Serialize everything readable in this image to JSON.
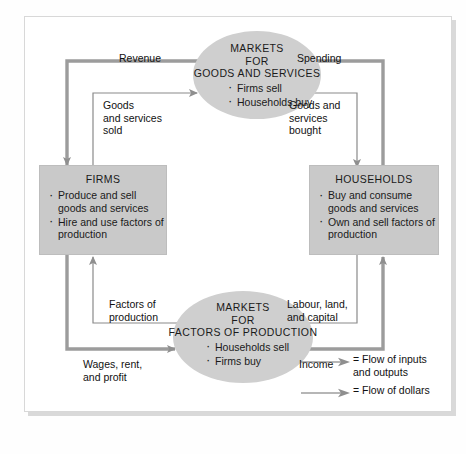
{
  "diagram": {
    "type": "circular-flow-diagram",
    "nodes": [
      {
        "id": "markets-goods-services",
        "shape": "ellipse",
        "title_lines": [
          "MARKETS",
          "FOR",
          "GOODS AND SERVICES"
        ],
        "bullets": [
          "Firms sell",
          "Households buy"
        ]
      },
      {
        "id": "firms",
        "shape": "rect",
        "title_lines": [
          "FIRMS"
        ],
        "bullets": [
          "Produce and sell goods and services",
          "Hire and use factors of production"
        ]
      },
      {
        "id": "households",
        "shape": "rect",
        "title_lines": [
          "HOUSEHOLDS"
        ],
        "bullets": [
          "Buy and consume goods and services",
          "Own and sell factors of production"
        ]
      },
      {
        "id": "markets-factors-production",
        "shape": "ellipse",
        "title_lines": [
          "MARKETS",
          "FOR",
          "FACTORS OF PRODUCTION"
        ],
        "bullets": [
          "Households sell",
          "Firms buy"
        ]
      }
    ],
    "flows": {
      "revenue": "Revenue",
      "goods_and_services_sold": "Goods\nand services\nsold",
      "spending": "Spending",
      "goods_and_services_bought": "Goods and\nservices\nbought",
      "factors_of_production": "Factors of\nproduction",
      "wages_rent_and_profit": "Wages, rent,\nand profit",
      "labour_land_and_capital": "Labour, land,\nand capital",
      "income": "Income"
    },
    "legend": [
      {
        "icon": "arrow-right-icon",
        "label": "= Flow of inputs\nand outputs"
      },
      {
        "icon": "arrow-right-icon",
        "label": "= Flow of dollars"
      }
    ],
    "colors": {
      "box_fill": "#c9c9c9",
      "ellipse_fill": "#cfcfcf",
      "dollar_arrow": "#8f8f8f",
      "input_arrow": "#8f8f8f",
      "thin_line": "#8a8a8a",
      "text": "#1a1a1a",
      "card_background": "#ffffff"
    }
  }
}
